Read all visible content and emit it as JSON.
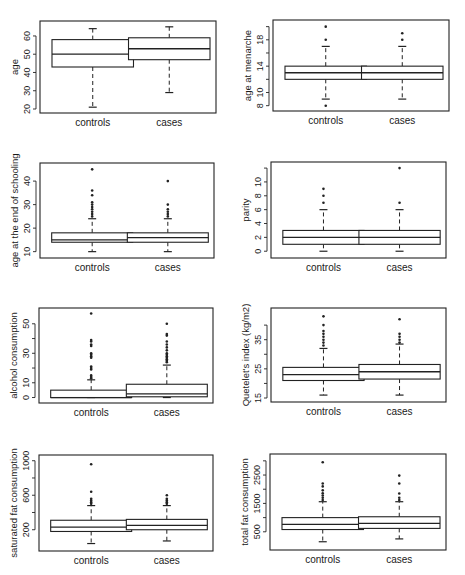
{
  "chart_data": [
    {
      "type": "box",
      "title": "",
      "xlabel": "",
      "ylabel": "age",
      "categories": [
        "controls",
        "cases"
      ],
      "ylim": [
        20,
        66
      ],
      "yticks": [
        20,
        30,
        40,
        50,
        60
      ],
      "yticklabels": [
        "20",
        "30",
        "40",
        "50",
        "60"
      ],
      "series": [
        {
          "name": "controls",
          "whisker_low": 21,
          "q1": 43,
          "median": 50,
          "q3": 58,
          "whisker_high": 64,
          "outliers": []
        },
        {
          "name": "cases",
          "whisker_low": 29,
          "q1": 47,
          "median": 53,
          "q3": 59,
          "whisker_high": 65,
          "outliers": []
        }
      ],
      "frame": {
        "x": 40,
        "y": 21,
        "w": 176,
        "h": 92
      }
    },
    {
      "type": "box",
      "title": "",
      "xlabel": "",
      "ylabel": "age at menarche",
      "categories": [
        "controls",
        "cases"
      ],
      "ylim": [
        7.8,
        20.4
      ],
      "yticks": [
        8,
        10,
        12,
        14,
        16,
        18,
        20
      ],
      "yticklabels": [
        "8",
        "10",
        "",
        "14",
        "",
        "18",
        ""
      ],
      "series": [
        {
          "name": "controls",
          "whisker_low": 9,
          "q1": 12,
          "median": 13,
          "q3": 14,
          "whisker_high": 17,
          "outliers": [
            8,
            18,
            20
          ]
        },
        {
          "name": "cases",
          "whisker_low": 9,
          "q1": 12,
          "median": 13,
          "q3": 14,
          "whisker_high": 17,
          "outliers": [
            18,
            19
          ]
        }
      ],
      "frame": {
        "x": 273,
        "y": 20,
        "w": 176,
        "h": 91
      }
    },
    {
      "type": "box",
      "title": "",
      "xlabel": "",
      "ylabel": "age at the end of schooling",
      "categories": [
        "controls",
        "cases"
      ],
      "ylim": [
        9,
        46
      ],
      "yticks": [
        10,
        20,
        30,
        40
      ],
      "yticklabels": [
        "10",
        "20",
        "30",
        "40"
      ],
      "series": [
        {
          "name": "controls",
          "whisker_low": 10,
          "q1": 14,
          "median": 15,
          "q3": 18,
          "whisker_high": 24,
          "outliers": [
            25,
            26,
            27,
            28,
            29,
            30,
            31,
            34,
            36,
            45
          ]
        },
        {
          "name": "cases",
          "whisker_low": 10,
          "q1": 14,
          "median": 16,
          "q3": 18,
          "whisker_high": 24,
          "outliers": [
            25,
            26,
            27,
            28,
            30,
            40
          ]
        }
      ],
      "frame": {
        "x": 40,
        "y": 163,
        "w": 174,
        "h": 95
      }
    },
    {
      "type": "box",
      "title": "",
      "xlabel": "",
      "ylabel": "parity",
      "categories": [
        "controls",
        "cases"
      ],
      "ylim": [
        -0.4,
        12.3
      ],
      "yticks": [
        0,
        2,
        4,
        6,
        8,
        10,
        12
      ],
      "yticklabels": [
        "0",
        "2",
        "4",
        "6",
        "8",
        "10",
        ""
      ],
      "series": [
        {
          "name": "controls",
          "whisker_low": 0,
          "q1": 1,
          "median": 2,
          "q3": 3,
          "whisker_high": 6,
          "outliers": [
            7,
            8,
            9
          ]
        },
        {
          "name": "cases",
          "whisker_low": 0,
          "q1": 1,
          "median": 2,
          "q3": 3,
          "whisker_high": 6,
          "outliers": [
            7,
            12
          ]
        }
      ],
      "frame": {
        "x": 271,
        "y": 162,
        "w": 175,
        "h": 96
      }
    },
    {
      "type": "box",
      "title": "",
      "xlabel": "",
      "ylabel": "alcohol consumption",
      "categories": [
        "controls",
        "cases"
      ],
      "ylim": [
        -1,
        58
      ],
      "yticks": [
        0,
        10,
        20,
        30,
        40,
        50
      ],
      "yticklabels": [
        "0",
        "10",
        "",
        "30",
        "",
        "50"
      ],
      "series": [
        {
          "name": "controls",
          "whisker_low": 0,
          "q1": 0,
          "median": 0,
          "q3": 5,
          "whisker_high": 12,
          "outliers": [
            13,
            14,
            15,
            19,
            20,
            21,
            27,
            28,
            29,
            30,
            35,
            36,
            38,
            39,
            57
          ]
        },
        {
          "name": "cases",
          "whisker_low": 0,
          "q1": 0.5,
          "median": 2.5,
          "q3": 9,
          "whisker_high": 22,
          "outliers": [
            24,
            25,
            26,
            27,
            28,
            29,
            30,
            32,
            34,
            36,
            38,
            42,
            43,
            50
          ]
        }
      ],
      "frame": {
        "x": 39,
        "y": 308,
        "w": 174,
        "h": 95
      }
    },
    {
      "type": "box",
      "title": "",
      "xlabel": "",
      "ylabel": "Quetelet's index (kg/m2)",
      "categories": [
        "controls",
        "cases"
      ],
      "ylim": [
        15,
        44.5
      ],
      "yticks": [
        15,
        20,
        25,
        30,
        35,
        40
      ],
      "yticklabels": [
        "15",
        "",
        "25",
        "",
        "35",
        ""
      ],
      "series": [
        {
          "name": "controls",
          "whisker_low": 16,
          "q1": 21,
          "median": 23,
          "q3": 25.5,
          "whisker_high": 32,
          "outliers": [
            33,
            34,
            35,
            36,
            37,
            38,
            40,
            43
          ]
        },
        {
          "name": "cases",
          "whisker_low": 16,
          "q1": 21.5,
          "median": 24,
          "q3": 26.5,
          "whisker_high": 33.5,
          "outliers": [
            34,
            35,
            36,
            37,
            42
          ]
        }
      ],
      "frame": {
        "x": 271,
        "y": 308,
        "w": 175,
        "h": 94
      }
    },
    {
      "type": "box",
      "title": "",
      "xlabel": "",
      "ylabel": "saturated fat consumption",
      "categories": [
        "controls",
        "cases"
      ],
      "ylim": [
        0,
        1020
      ],
      "yticks": [
        200,
        400,
        600,
        800,
        1000
      ],
      "yticklabels": [
        "200",
        "",
        "600",
        "",
        "1000"
      ],
      "series": [
        {
          "name": "controls",
          "whisker_low": 40,
          "q1": 180,
          "median": 230,
          "q3": 310,
          "whisker_high": 480,
          "outliers": [
            500,
            520,
            540,
            560,
            640,
            960
          ]
        },
        {
          "name": "cases",
          "whisker_low": 70,
          "q1": 200,
          "median": 250,
          "q3": 320,
          "whisker_high": 480,
          "outliers": [
            500,
            520,
            540,
            560,
            600
          ]
        }
      ],
      "frame": {
        "x": 39,
        "y": 455,
        "w": 174,
        "h": 96
      }
    },
    {
      "type": "box",
      "title": "",
      "xlabel": "",
      "ylabel": "total fat consumption",
      "categories": [
        "controls",
        "cases"
      ],
      "ylim": [
        0,
        3100
      ],
      "yticks": [
        500,
        1000,
        1500,
        2000,
        2500,
        3000
      ],
      "yticklabels": [
        "500",
        "",
        "1500",
        "",
        "2500",
        ""
      ],
      "series": [
        {
          "name": "controls",
          "whisker_low": 150,
          "q1": 580,
          "median": 760,
          "q3": 1000,
          "whisker_high": 1560,
          "outliers": [
            1620,
            1700,
            1780,
            1860,
            1960,
            2100,
            2200,
            2950
          ]
        },
        {
          "name": "cases",
          "whisker_low": 250,
          "q1": 620,
          "median": 800,
          "q3": 1030,
          "whisker_high": 1560,
          "outliers": [
            1620,
            1700,
            1850,
            2200,
            2480
          ]
        }
      ],
      "frame": {
        "x": 270,
        "y": 454,
        "w": 176,
        "h": 96
      }
    }
  ]
}
